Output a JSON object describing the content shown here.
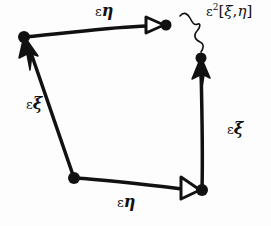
{
  "diagram": {
    "title": "",
    "colors": {
      "stroke": "#111111",
      "background": "#fdfdfd",
      "triangle_fill": "#ffffff"
    },
    "nodes": [
      {
        "id": "bottom-left",
        "x": 74,
        "y": 178
      },
      {
        "id": "bottom-right",
        "x": 202,
        "y": 190
      },
      {
        "id": "top-left",
        "x": 24,
        "y": 37
      },
      {
        "id": "top-right-eta-end",
        "x": 166,
        "y": 25
      },
      {
        "id": "right-xi-end",
        "x": 201,
        "y": 58
      }
    ],
    "edges": [
      {
        "from": "bottom-left",
        "to": "top-left",
        "label_id": "left_xi",
        "arrow": "filled"
      },
      {
        "from": "top-left",
        "to": "top-right-eta-end",
        "label_id": "top_eta",
        "arrow": "open-triangle"
      },
      {
        "from": "bottom-left",
        "to": "bottom-right",
        "label_id": "bottom_eta",
        "arrow": "open-triangle"
      },
      {
        "from": "bottom-right",
        "to": "right-xi-end",
        "label_id": "right_xi",
        "arrow": "filled"
      },
      {
        "from": "top-right-eta-end",
        "to": "right-xi-end",
        "label_id": "commutator",
        "style": "squiggle"
      }
    ],
    "labels": {
      "top_eta": {
        "eps": "ε",
        "symbol": "η"
      },
      "left_xi": {
        "eps": "ε",
        "symbol": "ξ"
      },
      "bottom_eta": {
        "eps": "ε",
        "symbol": "η"
      },
      "right_xi": {
        "eps": "ε",
        "symbol": "ξ"
      },
      "commutator": {
        "eps": "ε",
        "power": "2",
        "open": "[",
        "a": "ξ",
        "sep": ",",
        "b": "η",
        "close": "]"
      }
    }
  }
}
